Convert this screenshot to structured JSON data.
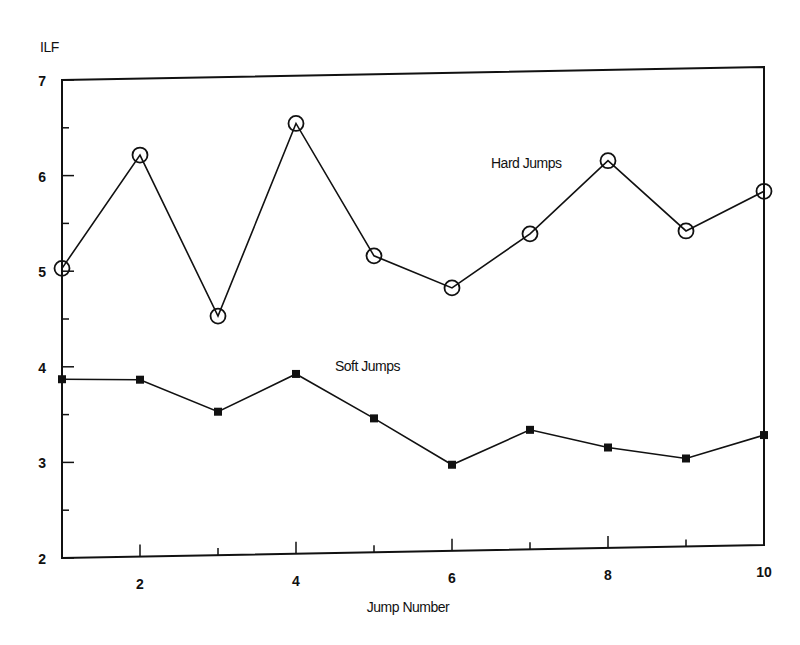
{
  "chart_data": {
    "type": "line",
    "title": "",
    "xlabel": "Jump Number",
    "ylabel": "ILF",
    "xlim": [
      1,
      10
    ],
    "ylim": [
      2,
      7
    ],
    "x_ticks": [
      2,
      4,
      6,
      8,
      10
    ],
    "y_ticks": [
      2,
      3,
      4,
      5,
      6,
      7
    ],
    "grid": false,
    "legend": "inline annotations",
    "x": [
      1,
      2,
      3,
      4,
      5,
      6,
      7,
      8,
      9,
      10
    ],
    "series": [
      {
        "name": "Hard Jumps",
        "marker": "open-circle",
        "values": [
          5.03,
          6.2,
          4.5,
          6.5,
          5.1,
          4.75,
          5.3,
          6.05,
          5.3,
          5.7
        ]
      },
      {
        "name": "Soft Jumps",
        "marker": "filled-square",
        "values": [
          3.87,
          3.85,
          3.5,
          3.88,
          3.4,
          2.9,
          3.25,
          3.05,
          2.92,
          3.15
        ]
      }
    ],
    "annotations": [
      {
        "text": "Hard Jumps",
        "x": 6.5,
        "y": 6.0
      },
      {
        "text": "Soft Jumps",
        "x": 4.5,
        "y": 3.9
      }
    ]
  }
}
